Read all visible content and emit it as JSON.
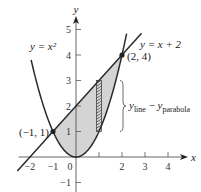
{
  "figure": {
    "curves": {
      "parabola": {
        "label": "y = x²",
        "equation": "y = x^2",
        "color": "#2a2a2a"
      },
      "line": {
        "label": "y = x + 2",
        "equation": "y = x + 2",
        "color": "#2a2a2a"
      }
    },
    "region": {
      "fill_color": "#d4d4d4",
      "between": [
        "y = x + 2",
        "y = x^2"
      ],
      "x_range": [
        -1,
        2
      ]
    },
    "intersections": [
      {
        "label": "(−1, 1)",
        "x": -1,
        "y": 1
      },
      {
        "label": "(2, 4)",
        "x": 2,
        "y": 4
      }
    ],
    "strip": {
      "x": 1,
      "hatched": true
    },
    "brace_label": {
      "base": "y",
      "sub1": "line",
      "minus": " − ",
      "base2": "y",
      "sub2": "parabola"
    },
    "axes": {
      "x_label": "x",
      "y_label": "y",
      "x_ticks": [
        "−2",
        "−1",
        "0",
        "2",
        "3",
        "4"
      ],
      "x_tick_values": [
        -2,
        -1,
        0,
        2,
        3,
        4
      ],
      "x_tick_marks": [
        1,
        2,
        3,
        4
      ],
      "y_ticks": [
        "−1",
        "1",
        "2",
        "3",
        "4",
        "5"
      ],
      "y_tick_values": [
        -1,
        1,
        2,
        3,
        4,
        5
      ]
    },
    "x_tick_one_label": "1"
  }
}
